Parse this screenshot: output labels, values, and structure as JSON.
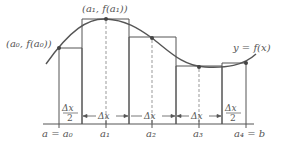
{
  "diagram": {
    "curve_label": "y = f(x)",
    "point_labels": {
      "a0": "(a₀, f(a₀))",
      "a1": "(a₁, f(a₁))"
    },
    "axis_labels": {
      "a0": "a = a₀",
      "a1": "a₁",
      "a2": "a₂",
      "a3": "a₃",
      "a4": "a₄ = b"
    },
    "width_labels": {
      "half_numerator": "Δx",
      "half_denominator": "2",
      "full": "Δx"
    },
    "colors": {
      "line": "#555555",
      "dashed": "#999999",
      "point": "#444444",
      "text": "#555555",
      "background": "#ffffff"
    },
    "nodes": [
      {
        "id": "a0",
        "x": 59,
        "y": 48
      },
      {
        "id": "a1",
        "x": 106,
        "y": 19
      },
      {
        "id": "a2",
        "x": 152,
        "y": 38
      },
      {
        "id": "a3",
        "x": 199,
        "y": 67
      },
      {
        "id": "a4",
        "x": 246,
        "y": 63
      }
    ],
    "rectangles": [
      {
        "x0": 59,
        "x1": 82,
        "top": 48
      },
      {
        "x0": 82,
        "x1": 129,
        "top": 19
      },
      {
        "x0": 129,
        "x1": 176,
        "top": 37
      },
      {
        "x0": 176,
        "x1": 222,
        "top": 66
      },
      {
        "x0": 222,
        "x1": 246,
        "top": 63
      }
    ]
  }
}
